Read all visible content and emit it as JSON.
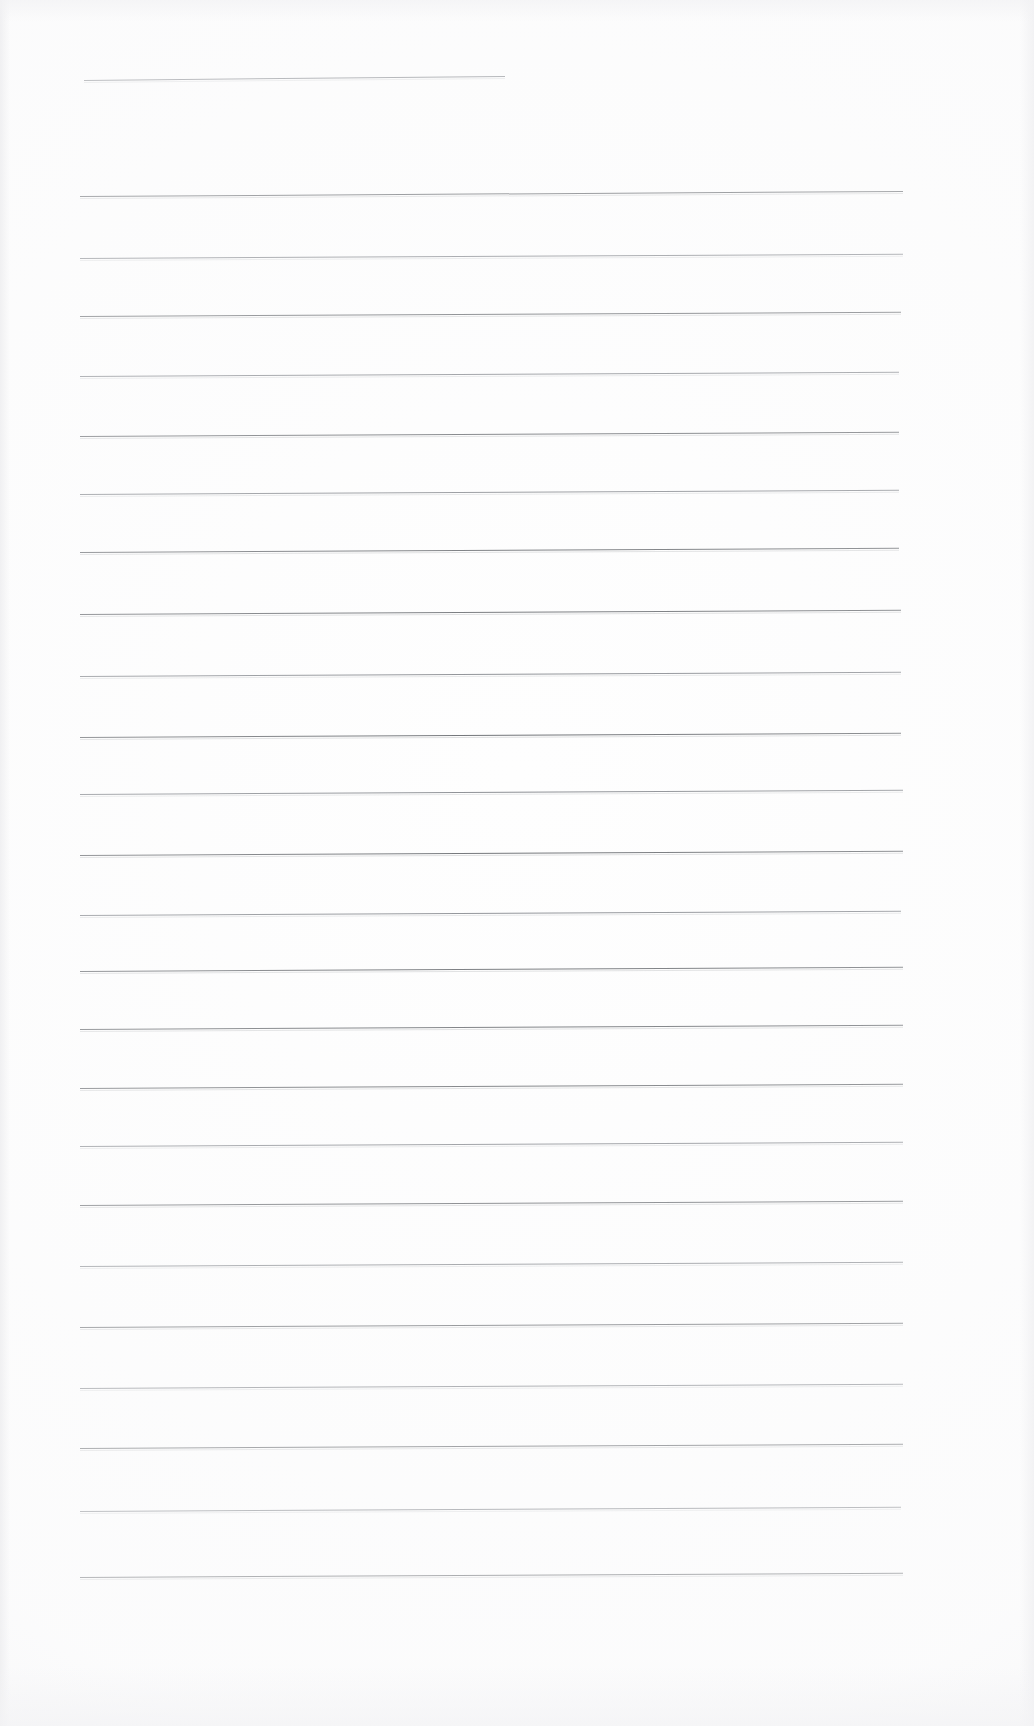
{
  "document": {
    "kind": "scanned-lined-paper",
    "title": "Blank ruled notebook page (scan)",
    "page_width": 1034,
    "page_height": 1726,
    "background_color": "#ffffff",
    "paper_color": "#fefefe",
    "rule_color": "#6f7276",
    "rule_color_faint": "#8c8f94",
    "content_text": "",
    "written_text": "",
    "visible_characters": 0
  },
  "chart_data": {
    "type": "table",
    "xlabel": "x position (px)",
    "ylabel": "y position (px)",
    "columns": [
      "index",
      "y",
      "x_start",
      "x_end",
      "weight",
      "tilt_deg"
    ],
    "rows": [
      [
        1,
        80,
        84,
        505,
        "faint",
        -0.55
      ],
      [
        2,
        196,
        80,
        903,
        "normal",
        -0.35
      ],
      [
        3,
        258,
        80,
        903,
        "faint",
        -0.3
      ],
      [
        4,
        316,
        80,
        901,
        "normal",
        -0.3
      ],
      [
        5,
        376,
        80,
        899,
        "faint",
        -0.3
      ],
      [
        6,
        436,
        80,
        899,
        "normal",
        -0.3
      ],
      [
        7,
        494,
        80,
        899,
        "faint",
        -0.3
      ],
      [
        8,
        552,
        80,
        899,
        "normal",
        -0.3
      ],
      [
        9,
        614,
        80,
        901,
        "normal",
        -0.3
      ],
      [
        10,
        676,
        80,
        901,
        "faint",
        -0.3
      ],
      [
        11,
        737,
        80,
        901,
        "normal",
        -0.3
      ],
      [
        12,
        794,
        80,
        903,
        "faint",
        -0.3
      ],
      [
        13,
        855,
        80,
        903,
        "normal",
        -0.3
      ],
      [
        14,
        915,
        80,
        901,
        "faint",
        -0.3
      ],
      [
        15,
        971,
        80,
        903,
        "normal",
        -0.3
      ],
      [
        16,
        1029,
        80,
        903,
        "normal",
        -0.3
      ],
      [
        17,
        1088,
        80,
        903,
        "normal",
        -0.3
      ],
      [
        18,
        1146,
        80,
        903,
        "faint",
        -0.3
      ],
      [
        19,
        1205,
        80,
        903,
        "normal",
        -0.3
      ],
      [
        20,
        1266,
        80,
        903,
        "faint",
        -0.3
      ],
      [
        21,
        1327,
        80,
        903,
        "normal",
        -0.3
      ],
      [
        22,
        1388,
        80,
        903,
        "faint",
        -0.3
      ],
      [
        23,
        1448,
        80,
        903,
        "normal",
        -0.3
      ],
      [
        24,
        1511,
        80,
        901,
        "faint",
        -0.3
      ],
      [
        25,
        1577,
        80,
        903,
        "normal",
        -0.3
      ]
    ],
    "line_count": 25,
    "ruled_line_spacing_px": 60,
    "left_margin_px": 80,
    "right_margin_px": 903,
    "grid": false,
    "legend": "none"
  }
}
